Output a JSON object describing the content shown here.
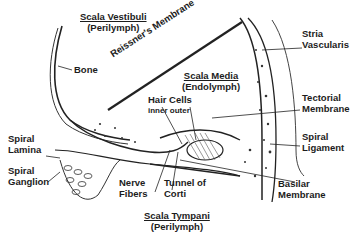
{
  "diagram": {
    "compartments": {
      "vestibuli": {
        "name": "Scala Vestibuli",
        "fluid": "(Perilymph)"
      },
      "media": {
        "name": "Scala Media",
        "fluid": "(Endolymph)"
      },
      "tympani": {
        "name": "Scala Tympani",
        "fluid": "(Perilymph)"
      }
    },
    "labels": {
      "bone": "Bone",
      "reissner": "Reissner's Membrane",
      "stria_1": "Stria",
      "stria_2": "Vascularis",
      "hair_cells": "Hair Cells",
      "hair_sub": "inner outer",
      "tectorial_1": "Tectorial",
      "tectorial_2": "Membrane",
      "spiral_lamina_1": "Spiral",
      "spiral_lamina_2": "Lamina",
      "spiral_ganglion_1": "Spiral",
      "spiral_ganglion_2": "Ganglion",
      "nerve_1": "Nerve",
      "nerve_2": "Fibers",
      "tunnel_1": "Tunnel of",
      "tunnel_2": "Corti",
      "spiral_ligament_1": "Spiral",
      "spiral_ligament_2": "Ligament",
      "basilar_1": "Basilar",
      "basilar_2": "Membrane"
    }
  }
}
